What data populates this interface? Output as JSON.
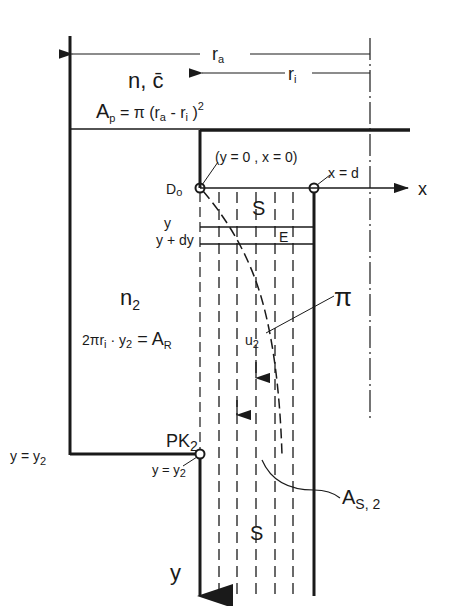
{
  "diagram": {
    "type": "technical-schematic",
    "colors": {
      "ink": "#1a1a1a",
      "paper": "#ffffff"
    },
    "dimensions": {
      "ra_label": "r",
      "ra_sub": "a",
      "ri_label": "r",
      "ri_sub": "i"
    },
    "top_region": {
      "label_n": "n, c̄",
      "area_formula_A": "A",
      "area_formula_sub": "p",
      "area_formula_rest": " = π (r",
      "area_ra_sub": "a",
      "area_mid": " - r",
      "area_ri_sub": "i",
      "area_end": " )",
      "area_exp": "2"
    },
    "origin": {
      "label": "D",
      "label_sub": "o",
      "coords": "(y = 0 , x = 0)"
    },
    "x_end": {
      "label": "x = d"
    },
    "axes": {
      "x": "x",
      "y": "y"
    },
    "grid": {
      "upper_S": "S",
      "cell_E": "E",
      "row_y": "y",
      "row_y_dy": "y + dy"
    },
    "left_region": {
      "label_n": "n",
      "label_n_sub": "2",
      "area_formula": "2πr",
      "area_formula_ri_sub": "i",
      "area_formula_mid": " · y",
      "area_formula_y_sub": "2",
      "area_formula_end": " = A",
      "area_formula_R_sub": "R"
    },
    "curve_labels": {
      "pi": "π",
      "u": "u",
      "u_sub": "2"
    },
    "pk": {
      "label": "PK",
      "label_sub": "2",
      "y_eq": "y = y",
      "y_eq_sub": "2"
    },
    "left_marker": {
      "label": "y = y",
      "label_sub": "2"
    },
    "lower_S": "S",
    "as_label": {
      "main": "A",
      "sub": "S, 2"
    }
  }
}
